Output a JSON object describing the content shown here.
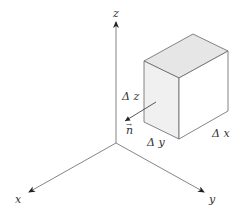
{
  "diagram": {
    "axes": {
      "x_label": "x",
      "y_label": "y",
      "z_label": "z"
    },
    "cube": {
      "dx_label": "Δ x",
      "dy_label": "Δ y",
      "dz_label": "Δ z",
      "top_face_color": "#e6e6e6",
      "left_face_color": "#f0f0f0",
      "right_face_color": "#ffffff"
    },
    "normal_vector": {
      "label": "n",
      "arrow_mark": "→"
    },
    "colors": {
      "line": "#777777",
      "arrow": "#222222",
      "text": "#333333"
    }
  }
}
